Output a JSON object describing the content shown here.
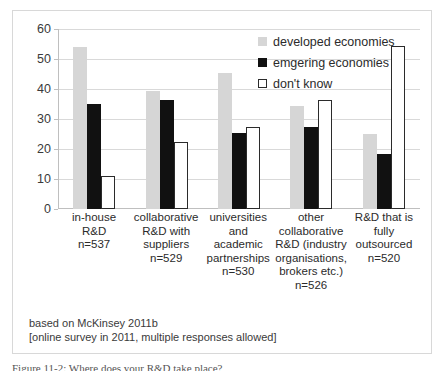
{
  "chart_data": {
    "type": "bar",
    "title": "",
    "xlabel": "",
    "ylabel": "",
    "ylim": [
      0,
      60
    ],
    "yticks": [
      0,
      10,
      20,
      30,
      40,
      50,
      60
    ],
    "grid": true,
    "legend_position": "inside-top-right",
    "categories": [
      "in-house R&D\nn=537",
      "collaborative\nR&D with\nsuppliers\nn=529",
      "universities\nand academic\npartnerships\nn=530",
      "other\ncollaborative\nR&D (industry\norganisations,\nbrokers etc.)\nn=526",
      "R&D that is\nfully\noutsourced\nn=520"
    ],
    "category_labels": [
      [
        "in-house R&D",
        "n=537"
      ],
      [
        "collaborative",
        "R&D with",
        "suppliers",
        "n=529"
      ],
      [
        "universities",
        "and academic",
        "partnerships",
        "n=530"
      ],
      [
        "other",
        "collaborative",
        "R&D (industry",
        "organisations,",
        "brokers etc.)",
        "n=526"
      ],
      [
        "R&D that is",
        "fully",
        "outsourced",
        "n=520"
      ]
    ],
    "series": [
      {
        "name": "developed economies",
        "color": "#d6d6d6",
        "values": [
          54,
          39.5,
          45.5,
          34.5,
          25
        ]
      },
      {
        "name": "emgering economies",
        "color": "#111111",
        "values": [
          35,
          36.5,
          25.5,
          27.5,
          18.5
        ]
      },
      {
        "name": "don't know",
        "color": "#ffffff",
        "values": [
          11,
          22.5,
          27.5,
          36.5,
          54.5
        ]
      }
    ],
    "annotations": [
      "based on McKinsey 2011b",
      "[online survey in 2011, multiple responses allowed]"
    ]
  },
  "legend": {
    "items": [
      {
        "label": "developed economies",
        "swatch": "developed"
      },
      {
        "label": "emgering economies",
        "swatch": "emerging"
      },
      {
        "label": "don't know",
        "swatch": "dontknow"
      }
    ]
  },
  "source_note": {
    "line1": "based on McKinsey 2011b",
    "line2": "[online survey in 2011, multiple responses allowed]"
  },
  "caption": {
    "text": "Figure 11-2: Where does your R&D take place?"
  },
  "colors": {
    "developed": "#d6d6d6",
    "emerging": "#111111",
    "dontknow_fill": "#ffffff",
    "dontknow_stroke": "#2b2b2b",
    "gridline": "#d9d9d9",
    "axis": "#bfbfbf",
    "frame": "#d8d8d8",
    "text": "#2b2b2b"
  }
}
